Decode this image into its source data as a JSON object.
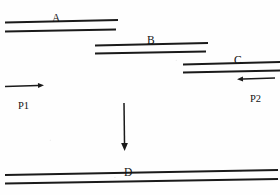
{
  "figure": {
    "width": 280,
    "height": 195,
    "background_color": "#fefefe",
    "ink_color": "#1a1a1a"
  },
  "fragments": [
    {
      "id": "A",
      "label": "A",
      "label_x": 52,
      "label_y": 13,
      "top_strand": {
        "x1": 5,
        "y1": 22.5,
        "x2": 118,
        "y2": 20.0
      },
      "bottom_strand": {
        "x1": 5,
        "y1": 31.5,
        "x2": 116,
        "y2": 29.5
      }
    },
    {
      "id": "B",
      "label": "B",
      "label_x": 147,
      "label_y": 35,
      "top_strand": {
        "x1": 95,
        "y1": 45.5,
        "x2": 208,
        "y2": 43.0
      },
      "bottom_strand": {
        "x1": 95,
        "y1": 53.5,
        "x2": 206,
        "y2": 51.5
      }
    },
    {
      "id": "C",
      "label": "C",
      "label_x": 234,
      "label_y": 55,
      "top_strand": {
        "x1": 183,
        "y1": 64.5,
        "x2": 280,
        "y2": 62.0
      },
      "bottom_strand": {
        "x1": 183,
        "y1": 72.5,
        "x2": 280,
        "y2": 70.5
      }
    }
  ],
  "product": {
    "id": "D",
    "label": "D",
    "label_x": 124,
    "label_y": 167,
    "top_strand": {
      "x1": 5,
      "y1": 175.0,
      "x2": 278,
      "y2": 170.0
    },
    "bottom_strand": {
      "x1": 5,
      "y1": 183.5,
      "x2": 278,
      "y2": 179.0
    }
  },
  "primers": [
    {
      "id": "P1",
      "label": "P1",
      "label_x": 18,
      "label_y": 101,
      "direction": "right",
      "shaft": {
        "x1": 5,
        "y1": 86.5,
        "x2": 38,
        "y2": 85.5
      },
      "tip": {
        "x": 44,
        "y": 85.3
      }
    },
    {
      "id": "P2",
      "label": "P2",
      "label_x": 250,
      "label_y": 94,
      "direction": "left",
      "shaft": {
        "x1": 275,
        "y1": 78.0,
        "x2": 243,
        "y2": 79.0
      },
      "tip": {
        "x": 237,
        "y": 79.2
      }
    }
  ],
  "reaction_arrow": {
    "id": "assembly-arrow",
    "direction": "down",
    "shaft": {
      "x1": 124,
      "y1": 103,
      "x2": 124.5,
      "y2": 143
    },
    "tip": {
      "x": 124.6,
      "y": 151
    }
  }
}
